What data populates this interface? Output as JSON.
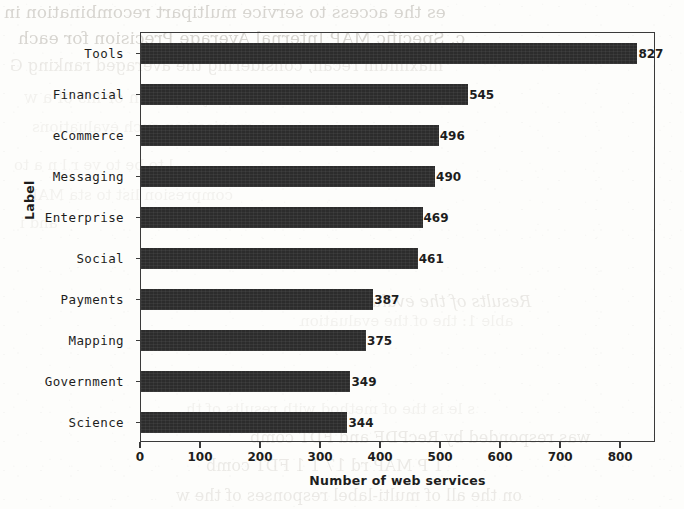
{
  "chart_data": {
    "type": "bar",
    "orientation": "horizontal",
    "title": "",
    "xlabel": "Number of web services",
    "ylabel": "Label",
    "categories": [
      "Tools",
      "Financial",
      "eCommerce",
      "Messaging",
      "Enterprise",
      "Social",
      "Payments",
      "Mapping",
      "Government",
      "Science"
    ],
    "values": [
      827,
      545,
      496,
      490,
      469,
      461,
      387,
      375,
      349,
      344
    ],
    "value_labels": [
      "827",
      "545",
      "496",
      "490",
      "469",
      "461",
      "387",
      "375",
      "349",
      "344"
    ],
    "xlim": [
      0,
      858
    ],
    "xticks": [
      0,
      100,
      200,
      300,
      400,
      500,
      600,
      700,
      800
    ],
    "xtick_labels": [
      "0",
      "100",
      "200",
      "300",
      "400",
      "500",
      "600",
      "700",
      "800"
    ],
    "grid": false,
    "legend": null,
    "bar_color": "#2c2c2c",
    "frame_color": "#3a3a3a",
    "background_color": "#fdfdfb"
  },
  "page": {
    "media": "scanned-document-page",
    "bleed_through_lines": [
      "es the access to service multipart recombination in",
      "c. Specific MAP Internal Average Precision for each",
      "maximum recall, considering the averaged ranking G",
      "d as a   k y  recision    or    ms    of  a  w",
      "rparison on  such evaluations",
      "l       to  be   to   ve    r   l       n   a   to",
      "compresion list to     sta    MAP",
      "and  i",
      "Results of the evaluation",
      "able 1:  the  of   the   evaluation",
      "s  le is the     of method    with   results  of  th",
      "was   responded by   RecPDF  and     FDT    comb",
      "1    P  MAP   rd   17     1      1     FDT  comb",
      "on the  all of multi-label   responses  of the  w"
    ]
  }
}
